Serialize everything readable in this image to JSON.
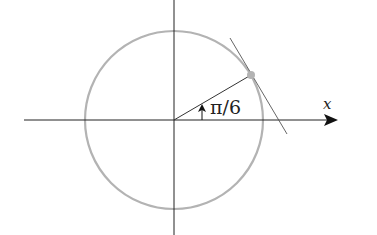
{
  "diagram": {
    "type": "unit-circle-tangent",
    "labels": {
      "angle": "π/6",
      "x_axis": "x"
    },
    "colors": {
      "axis": "#222222",
      "circle": "#b3b3b3",
      "point": "#b3b3b3",
      "radius": "#333333",
      "tangent": "#555555"
    },
    "geometry": {
      "center": [
        174,
        120
      ],
      "radius": 89,
      "angle_deg": 30,
      "point": [
        251,
        75
      ]
    }
  }
}
